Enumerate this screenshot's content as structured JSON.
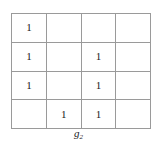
{
  "figure": {
    "caption_symbol": "g",
    "caption_subscript": "2"
  },
  "chart_data": {
    "type": "table",
    "title": "",
    "xlabel": "",
    "ylabel": "",
    "rows": 4,
    "columns": 4,
    "cell_mark": "1",
    "empty_cell": "",
    "grid": [
      [
        "1",
        "",
        "",
        ""
      ],
      [
        "1",
        "",
        "1",
        ""
      ],
      [
        "1",
        "",
        "1",
        ""
      ],
      [
        "",
        "1",
        "1",
        ""
      ]
    ],
    "marked_cells": [
      {
        "row": 1,
        "col": 1
      },
      {
        "row": 2,
        "col": 1
      },
      {
        "row": 2,
        "col": 3
      },
      {
        "row": 3,
        "col": 1
      },
      {
        "row": 3,
        "col": 3
      },
      {
        "row": 4,
        "col": 2
      },
      {
        "row": 4,
        "col": 3
      }
    ],
    "grid_line_color": "#9a9a9a",
    "text_color": "#1a1a1a",
    "background_color": "#ffffff"
  }
}
